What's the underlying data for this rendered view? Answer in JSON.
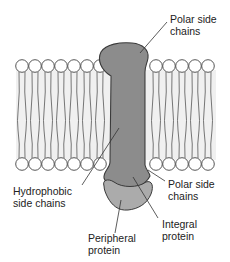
{
  "diagram": {
    "colors": {
      "background": "#ffffff",
      "bilayer_fill": "#f0f0f0",
      "lipid_head_fill": "#ffffff",
      "outline": "#444444",
      "integral_protein": "#8c8c8c",
      "peripheral_protein": "#ababab",
      "leader_line": "#333333"
    },
    "labels": {
      "polar_top_line1": "Polar side",
      "polar_top_line2": "chains",
      "hydrophobic_line1": "Hydrophobic",
      "hydrophobic_line2": "side chains",
      "polar_bottom_line1": "Polar side",
      "polar_bottom_line2": "chains",
      "integral_line1": "Integral",
      "integral_line2": "protein",
      "peripheral_line1": "Peripheral",
      "peripheral_line2": "protein"
    },
    "components": [
      "lipid-bilayer",
      "integral-protein",
      "peripheral-protein"
    ]
  }
}
